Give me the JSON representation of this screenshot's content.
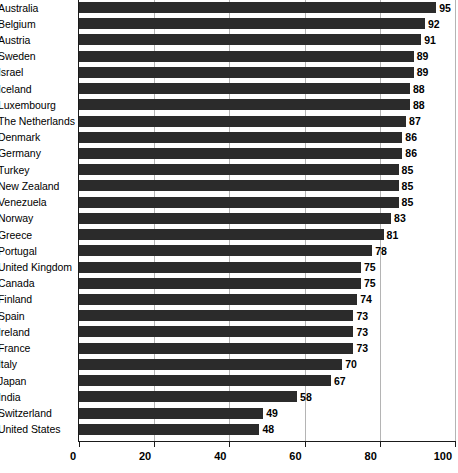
{
  "chart_data": {
    "type": "bar",
    "orientation": "horizontal",
    "title": "",
    "subtitle": "",
    "xlabel": "",
    "ylabel": "",
    "xlim": [
      0,
      100
    ],
    "grid": true,
    "legend": null,
    "xticks": [
      0,
      20,
      40,
      60,
      80,
      100
    ],
    "xtick_labels": [
      "0",
      "20",
      "40",
      "60",
      "80",
      "100"
    ],
    "bar_color": "#2b2b2b",
    "gridline_color": "#b4b4b4",
    "axis_color": "#1a1a1a",
    "background_color": "#ffffff",
    "categories": [
      "Australia",
      "Belgium",
      "Austria",
      "Sweden",
      "Israel",
      "Iceland",
      "Luxembourg",
      "The Netherlands",
      "Denmark",
      "Germany",
      "Turkey",
      "New Zealand",
      "Venezuela",
      "Norway",
      "Greece",
      "Portugal",
      "United Kingdom",
      "Canada",
      "Finland",
      "Spain",
      "Ireland",
      "France",
      "Italy",
      "Japan",
      "India",
      "Switzerland",
      "United States"
    ],
    "values": [
      95,
      92,
      91,
      89,
      89,
      88,
      88,
      87,
      86,
      86,
      85,
      85,
      85,
      83,
      81,
      78,
      75,
      75,
      74,
      73,
      73,
      73,
      70,
      67,
      58,
      49,
      48
    ],
    "value_labels": [
      "95",
      "92",
      "91",
      "89",
      "89",
      "88",
      "88",
      "87",
      "86",
      "86",
      "85",
      "85",
      "85",
      "83",
      "81",
      "78",
      "75",
      "75",
      "74",
      "73",
      "73",
      "73",
      "70",
      "67",
      "58",
      "49",
      "48"
    ]
  }
}
